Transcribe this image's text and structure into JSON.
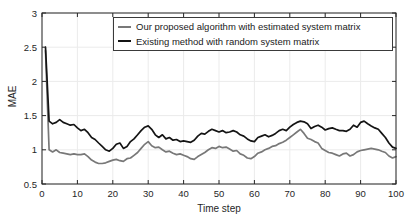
{
  "figure": {
    "background": "#ffffff",
    "axis_color": "#262626",
    "grid_color": "#ebebeb",
    "tick_label_color": "#262626"
  },
  "chart_data": {
    "type": "line",
    "title": "",
    "xlabel": "Time step",
    "ylabel": "MAE",
    "xlim": [
      0,
      100
    ],
    "ylim": [
      0.5,
      3
    ],
    "x_ticks": [
      0,
      10,
      20,
      30,
      40,
      50,
      60,
      70,
      80,
      90,
      100
    ],
    "y_ticks": [
      0.5,
      1,
      1.5,
      2,
      2.5,
      3
    ],
    "grid": true,
    "legend_position": "top-center-inside",
    "x_start": 1,
    "x_step": 1,
    "series": [
      {
        "name": "Our proposed algorithm with estimated system matrix",
        "color": "#787878",
        "values": [
          2.45,
          1.0,
          0.97,
          1.0,
          0.96,
          0.95,
          0.94,
          0.93,
          0.94,
          0.93,
          0.93,
          0.94,
          0.9,
          0.85,
          0.82,
          0.8,
          0.8,
          0.81,
          0.83,
          0.85,
          0.86,
          0.84,
          0.83,
          0.87,
          0.88,
          0.92,
          0.96,
          1.02,
          1.08,
          1.12,
          1.06,
          1.03,
          1.04,
          1.0,
          0.97,
          0.98,
          0.95,
          0.93,
          0.94,
          0.92,
          0.9,
          0.87,
          0.86,
          0.9,
          0.93,
          0.96,
          1.0,
          1.03,
          1.02,
          1.05,
          1.03,
          1.04,
          1.01,
          0.98,
          0.99,
          0.94,
          0.92,
          0.88,
          0.87,
          0.9,
          0.95,
          0.97,
          1.0,
          1.02,
          1.05,
          1.06,
          1.09,
          1.11,
          1.14,
          1.18,
          1.22,
          1.26,
          1.3,
          1.24,
          1.17,
          1.15,
          1.12,
          1.1,
          1.02,
          0.99,
          0.96,
          0.95,
          0.93,
          0.91,
          0.94,
          0.95,
          0.91,
          0.93,
          0.97,
          0.99,
          1.0,
          1.01,
          1.02,
          1.01,
          1.0,
          0.98,
          0.96,
          0.91,
          0.88,
          0.9
        ]
      },
      {
        "name": "Existing method with random system matrix",
        "color": "#141414",
        "values": [
          2.5,
          1.42,
          1.38,
          1.4,
          1.44,
          1.4,
          1.38,
          1.36,
          1.37,
          1.32,
          1.28,
          1.3,
          1.25,
          1.18,
          1.15,
          1.1,
          1.05,
          1.0,
          0.98,
          1.02,
          1.08,
          1.1,
          1.02,
          1.05,
          1.12,
          1.16,
          1.22,
          1.28,
          1.33,
          1.35,
          1.3,
          1.22,
          1.18,
          1.22,
          1.16,
          1.18,
          1.14,
          1.15,
          1.12,
          1.13,
          1.12,
          1.11,
          1.14,
          1.2,
          1.24,
          1.23,
          1.27,
          1.3,
          1.28,
          1.26,
          1.28,
          1.25,
          1.26,
          1.28,
          1.26,
          1.22,
          1.2,
          1.16,
          1.13,
          1.12,
          1.18,
          1.2,
          1.22,
          1.19,
          1.21,
          1.24,
          1.28,
          1.3,
          1.28,
          1.33,
          1.37,
          1.4,
          1.42,
          1.41,
          1.38,
          1.31,
          1.34,
          1.36,
          1.33,
          1.29,
          1.31,
          1.32,
          1.3,
          1.28,
          1.28,
          1.27,
          1.3,
          1.36,
          1.33,
          1.4,
          1.42,
          1.38,
          1.35,
          1.32,
          1.3,
          1.24,
          1.18,
          1.1,
          1.04,
          1.02
        ]
      }
    ]
  }
}
